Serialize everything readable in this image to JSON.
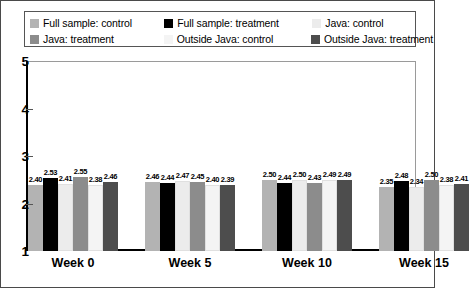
{
  "legend": {
    "items": [
      {
        "label": "Full sample: control",
        "color": "#b3b3b3",
        "key": "full_control"
      },
      {
        "label": "Full sample: treatment",
        "color": "#000000",
        "key": "full_treatment"
      },
      {
        "label": "Java: control",
        "color": "#ececec",
        "key": "java_control"
      },
      {
        "label": "Java: treatment",
        "color": "#8c8c8c",
        "key": "java_treatment"
      },
      {
        "label": "Outside Java: control",
        "color": "#f4f4f4",
        "key": "outside_control"
      },
      {
        "label": "Outside Java: treatment",
        "color": "#4d4d4d",
        "key": "outside_treatment"
      }
    ]
  },
  "axis": {
    "y_ticks": [
      "5",
      "4",
      "3",
      "2",
      "1"
    ],
    "x_labels": [
      "Week 0",
      "Week 5",
      "Week 10",
      "Week 15"
    ]
  },
  "chart_data": {
    "type": "bar",
    "title": "",
    "xlabel": "",
    "ylabel": "",
    "ylim": [
      1,
      5
    ],
    "yticks": [
      1,
      2,
      3,
      4,
      5
    ],
    "grid": false,
    "legend_position": "top",
    "baseline": 1,
    "categories": [
      "Week 0",
      "Week 5",
      "Week 10",
      "Week 15"
    ],
    "series": [
      {
        "name": "Full sample: control",
        "color": "#b3b3b3",
        "values": [
          2.4,
          2.46,
          2.5,
          2.35
        ]
      },
      {
        "name": "Full sample: treatment",
        "color": "#000000",
        "values": [
          2.53,
          2.44,
          2.44,
          2.48
        ]
      },
      {
        "name": "Java: control",
        "color": "#ececec",
        "values": [
          2.41,
          2.47,
          2.5,
          2.34
        ]
      },
      {
        "name": "Java: treatment",
        "color": "#8c8c8c",
        "values": [
          2.55,
          2.45,
          2.43,
          2.5
        ]
      },
      {
        "name": "Outside Java: control",
        "color": "#f4f4f4",
        "values": [
          2.38,
          2.4,
          2.49,
          2.38
        ]
      },
      {
        "name": "Outside Java: treatment",
        "color": "#4d4d4d",
        "values": [
          2.46,
          2.39,
          2.49,
          2.41
        ]
      }
    ],
    "data_labels": [
      [
        "2.40",
        "2.53",
        "2.41",
        "2.55",
        "2.38",
        "2.46"
      ],
      [
        "2.46",
        "2.44",
        "2.47",
        "2.45",
        "2.40",
        "2.39"
      ],
      [
        "2.50",
        "2.44",
        "2.50",
        "2.43",
        "2.49",
        "2.49"
      ],
      [
        "2.35",
        "2.48",
        "2.34",
        "2.50",
        "2.38",
        "2.41"
      ]
    ]
  }
}
